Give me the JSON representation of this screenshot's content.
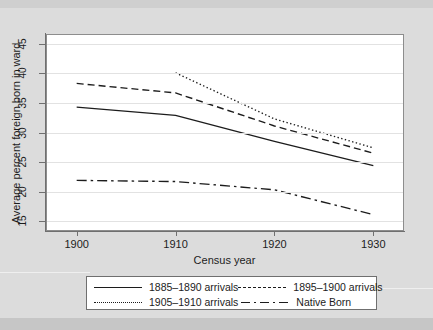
{
  "chart_data": {
    "type": "line",
    "title": "",
    "xlabel": "Census year",
    "ylabel": "Average percent foreign born in ward",
    "x": [
      1900,
      1910,
      1920,
      1930
    ],
    "xlim": [
      1897,
      1933
    ],
    "ylim": [
      13.5,
      46.5
    ],
    "xticks": [
      1900,
      1910,
      1920,
      1930
    ],
    "yticks": [
      15,
      20,
      25,
      30,
      35,
      40,
      45
    ],
    "grid": "horizontal",
    "legend_position": "below-axes",
    "series": [
      {
        "name": "1885-1890 arrivals",
        "style": "solid",
        "color": "#1c1c1c",
        "x": [
          1900,
          1910,
          1920,
          1930
        ],
        "values": [
          34.3,
          32.9,
          28.5,
          24.4
        ]
      },
      {
        "name": "1895-1900 arrivals",
        "style": "dashed",
        "color": "#1c1c1c",
        "x": [
          1900,
          1910,
          1920,
          1930
        ],
        "values": [
          38.3,
          36.7,
          31.1,
          26.5
        ]
      },
      {
        "name": "1905-1910 arrivals",
        "style": "dotted",
        "color": "#1c1c1c",
        "x": [
          1910,
          1920,
          1930
        ],
        "values": [
          40.1,
          32.3,
          27.4
        ]
      },
      {
        "name": "Native Born",
        "style": "dashdot",
        "color": "#1c1c1c",
        "x": [
          1900,
          1910,
          1920,
          1930
        ],
        "values": [
          21.9,
          21.7,
          20.3,
          16.1
        ]
      }
    ]
  },
  "axes": {
    "y_title": "Average percent foreign born in ward",
    "x_title": "Census year",
    "y_tick_labels": [
      "45",
      "40",
      "35",
      "30",
      "25",
      "20",
      "15"
    ],
    "x_tick_labels": [
      "1900",
      "1910",
      "1920",
      "1930"
    ]
  },
  "legend": {
    "entries": [
      {
        "label": "1885–1890 arrivals",
        "style": "solid"
      },
      {
        "label": "1895–1900 arrivals",
        "style": "dash"
      },
      {
        "label": "1905–1910 arrivals",
        "style": "dot"
      },
      {
        "label": "Native Born",
        "style": "dashdot"
      }
    ]
  },
  "colors": {
    "page_background": "#dcdcdc",
    "plot_background": "#ffffff",
    "axis": "#6f6f6f",
    "grid": "#e2e2e2",
    "line": "#1c1c1c",
    "text": "#1c1c1c"
  }
}
